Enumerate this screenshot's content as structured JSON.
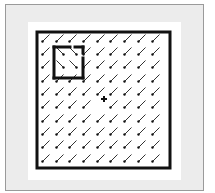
{
  "diagram": {
    "colors": {
      "frame_fill": "#ececec",
      "frame_border": "#9a9a9a",
      "panel": "#ffffff",
      "stroke": "#111111",
      "vector": "#333333"
    },
    "outer_square": {
      "x": 37,
      "y": 32,
      "width": 133,
      "height": 136,
      "stroke_width": 3
    },
    "inner_square": {
      "x": 54,
      "y": 47,
      "width": 29,
      "height": 31,
      "stroke_width": 3,
      "style": "dashed-gaps"
    },
    "grid": {
      "columns": 9,
      "rows": 10,
      "x_centers": [
        46,
        60,
        73,
        87,
        101,
        114,
        128,
        142,
        156
      ],
      "y_centers": [
        38,
        51,
        64,
        78,
        91,
        104,
        118,
        131,
        144,
        158
      ],
      "default_direction": "down-left",
      "inner_direction": "down-right",
      "inner_cells": [
        [
          1,
          1
        ],
        [
          2,
          1
        ],
        [
          1,
          2
        ],
        [
          2,
          2
        ]
      ]
    },
    "center_marker": {
      "symbol": "+",
      "x": 104,
      "y": 99
    }
  }
}
